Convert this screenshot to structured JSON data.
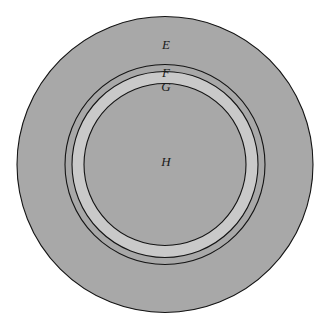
{
  "figure": {
    "kind": "concentric-circles-diagram",
    "background_color": "#ffffff",
    "center": {
      "x": 165,
      "y": 164.5
    },
    "stroke_color": "#141414",
    "stroke_width": 1.1,
    "fill_gray": "#a8a8a8",
    "fill_light": "#c9c9c9",
    "regions": [
      {
        "label": "E",
        "description": "outer annulus",
        "outer_radius": 148,
        "inner_radius": 100,
        "fill": "#a8a8a8",
        "label_x": 166,
        "label_y": 46
      },
      {
        "label": "F",
        "description": "second annulus",
        "outer_radius": 100,
        "inner_radius": 93,
        "fill": "#a8a8a8",
        "label_x": 166,
        "label_y": 74
      },
      {
        "label": "G",
        "description": "third annulus, lighter band",
        "outer_radius": 93,
        "inner_radius": 81,
        "fill": "#c9c9c9",
        "label_x": 166,
        "label_y": 88
      },
      {
        "label": "H",
        "description": "inner disc",
        "outer_radius": 81,
        "inner_radius": 0,
        "fill": "#a8a8a8",
        "label_x": 166,
        "label_y": 163
      }
    ],
    "circle_radii": [
      148,
      100,
      93,
      81
    ]
  }
}
